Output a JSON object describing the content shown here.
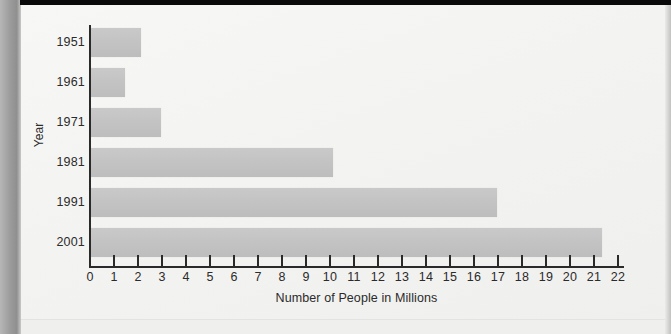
{
  "chart_data": {
    "type": "bar",
    "orientation": "horizontal",
    "title": "",
    "xlabel": "Number of People in Millions",
    "ylabel": "Year",
    "categories": [
      "1951",
      "1961",
      "1971",
      "1981",
      "1991",
      "2001"
    ],
    "values": [
      2.1,
      1.4,
      2.9,
      10.1,
      16.9,
      21.3
    ],
    "xlim": [
      0,
      22
    ],
    "xticks": [
      "0",
      "1",
      "2",
      "3",
      "4",
      "5",
      "6",
      "7",
      "8",
      "9",
      "10",
      "11",
      "12",
      "13",
      "14",
      "15",
      "16",
      "17",
      "18",
      "19",
      "20",
      "21",
      "22"
    ],
    "grid": false,
    "legend": null,
    "series": [
      {
        "name": "Number of People in Millions",
        "values": [
          2.1,
          1.4,
          2.9,
          10.1,
          16.9,
          21.3
        ]
      }
    ],
    "bar_color": "#c4c4c4",
    "axis_color": "#2a2a2a",
    "background_color": "#f3f3f1"
  }
}
